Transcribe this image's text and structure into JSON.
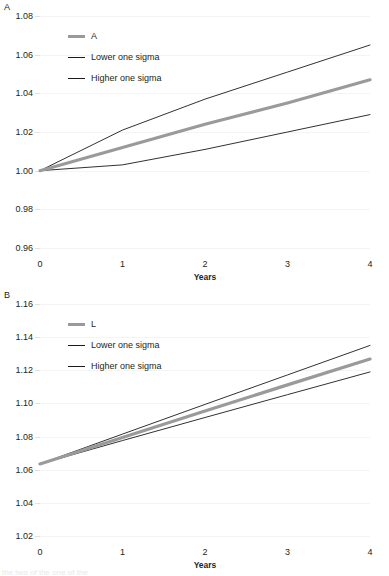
{
  "figure": {
    "background": "#ffffff",
    "series_color": "#9a9a9a",
    "sigma_color": "#1a1a1a",
    "grid_color": "#f4f4f4",
    "bottom_cut_text": "the two of the one of the"
  },
  "panels": [
    {
      "label": "A",
      "legend": [
        {
          "name": "series-a",
          "label": "A",
          "style": "thick"
        },
        {
          "name": "lower-one-sigma",
          "label": "Lower one sigma",
          "style": "thin"
        },
        {
          "name": "higher-one-sigma",
          "label": "Higher one sigma",
          "style": "thin"
        }
      ],
      "yticks": [
        "1.08",
        "1.06",
        "1.04",
        "1.02",
        "1.00",
        "0.98",
        "0.96"
      ],
      "xticks": [
        "0",
        "1",
        "2",
        "3",
        "4"
      ],
      "xlabel": "Years"
    },
    {
      "label": "B",
      "legend": [
        {
          "name": "series-l",
          "label": "L",
          "style": "thick"
        },
        {
          "name": "lower-one-sigma",
          "label": "Lower one sigma",
          "style": "thin"
        },
        {
          "name": "higher-one-sigma",
          "label": "Higher one sigma",
          "style": "thin"
        }
      ],
      "yticks": [
        "1.16",
        "1.14",
        "1.12",
        "1.10",
        "1.08",
        "1.06",
        "1.04",
        "1.02"
      ],
      "xticks": [
        "0",
        "1",
        "2",
        "3",
        "4"
      ],
      "xlabel": "Years"
    }
  ],
  "chart_data": [
    {
      "type": "line",
      "panel": "A",
      "title": "A",
      "xlabel": "Years",
      "ylabel": "",
      "x": [
        0,
        1,
        2,
        3,
        4
      ],
      "xlim": [
        0,
        4
      ],
      "ylim": [
        0.96,
        1.08
      ],
      "yticks": [
        0.96,
        0.98,
        1.0,
        1.02,
        1.04,
        1.02,
        1.06,
        1.08
      ],
      "grid": true,
      "legend_position": "top-left",
      "series": [
        {
          "name": "A",
          "style": "thick-grey",
          "values": [
            1.0,
            1.012,
            1.024,
            1.035,
            1.047
          ]
        },
        {
          "name": "Higher one sigma",
          "style": "thin-black",
          "values": [
            1.0,
            1.021,
            1.037,
            1.051,
            1.065
          ]
        },
        {
          "name": "Lower one sigma",
          "style": "thin-black",
          "values": [
            1.0,
            1.003,
            1.011,
            1.02,
            1.029
          ]
        }
      ]
    },
    {
      "type": "line",
      "panel": "B",
      "title": "B",
      "xlabel": "Years",
      "ylabel": "",
      "x": [
        0,
        1,
        2,
        3,
        4
      ],
      "xlim": [
        0,
        4
      ],
      "ylim": [
        1.02,
        1.16
      ],
      "yticks": [
        1.02,
        1.04,
        1.06,
        1.08,
        1.1,
        1.12,
        1.14,
        1.16
      ],
      "grid": true,
      "legend_position": "top-left",
      "series": [
        {
          "name": "L",
          "style": "thick-grey",
          "values": [
            1.0635,
            1.0795,
            1.0954,
            1.1112,
            1.1268
          ]
        },
        {
          "name": "Higher one sigma",
          "style": "thin-black",
          "values": [
            1.0635,
            1.0815,
            1.0994,
            1.1172,
            1.135
          ]
        },
        {
          "name": "Lower one sigma",
          "style": "thin-black",
          "values": [
            1.0635,
            1.0776,
            1.0915,
            1.1053,
            1.119
          ]
        }
      ]
    }
  ]
}
